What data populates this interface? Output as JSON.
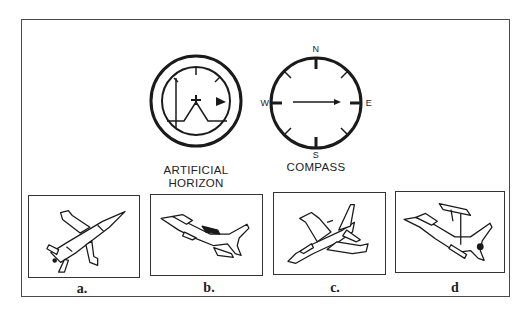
{
  "instruments": {
    "artificial_horizon": {
      "label_line1": "ARTIFICIAL",
      "label_line2": "HORIZON"
    },
    "compass": {
      "label": "COMPASS",
      "north": "N",
      "south": "S",
      "east": "E",
      "west": "W"
    }
  },
  "options": [
    {
      "id": "a",
      "label": "a."
    },
    {
      "id": "b",
      "label": "b."
    },
    {
      "id": "c",
      "label": "c."
    },
    {
      "id": "d",
      "label": "d"
    }
  ],
  "colors": {
    "line": "#1a1a1a",
    "frame": "#4a4a4a",
    "background": "#ffffff"
  }
}
